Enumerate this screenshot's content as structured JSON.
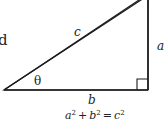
{
  "diagram": {
    "type": "right-triangle",
    "labels": {
      "hypotenuse": "c",
      "opposite": "a",
      "adjacent": "b",
      "angle": "θ"
    },
    "equation": {
      "a": "a",
      "b": "b",
      "c": "c",
      "exp": "2",
      "plus": "+",
      "equals": "="
    },
    "cropped_text": "d",
    "stroke_color": "#1a1a1a"
  }
}
